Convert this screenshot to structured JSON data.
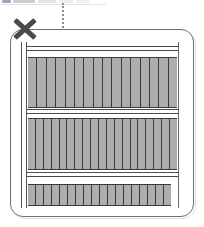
{
  "figure": {
    "background_color": "#ffffff",
    "width": 204,
    "height": 227
  },
  "top_strip": {
    "name": "cut-off-header-strip",
    "segments": [
      "",
      "",
      "",
      "",
      ""
    ],
    "colors": [
      "#8e9aa8",
      "#9aa5b1",
      "#c4d2dd",
      "#cfdbe5",
      "#d8e3eb"
    ],
    "rule_color": "#cfe0ea"
  },
  "leader_line": {
    "name": "dotted-leader-line",
    "style": "dotted",
    "color": "#7a7a7a",
    "orientation": "vertical"
  },
  "annotation": {
    "mark": "X",
    "label": "",
    "color": "#4a4a4a",
    "position": "top-left"
  },
  "panel": {
    "name": "rounded-panel",
    "border_color": "#6f6f6f",
    "fill_color": "#ffffff",
    "corner_radius": 13
  },
  "frame": {
    "rail_color": "#4a4a4a",
    "left_rail": "double-vertical-rail",
    "right_rail": "single-vertical-rail"
  },
  "bands": [
    {
      "name": "band-top",
      "bar_count": 16,
      "fill_color": "#adadad",
      "separator_color": "#3a3a3a",
      "top": 57,
      "left": 28,
      "width": 149,
      "height": 51
    },
    {
      "name": "band-middle",
      "bar_count": 19,
      "fill_color": "#adadad",
      "separator_color": "#3a3a3a",
      "top": 118,
      "left": 28,
      "width": 149,
      "height": 52
    },
    {
      "name": "band-bottom",
      "bar_count": 18,
      "fill_color": "#adadad",
      "separator_color": "#3a3a3a",
      "top": 184,
      "left": 28,
      "width": 143,
      "height": 22
    }
  ],
  "rails": [
    {
      "name": "rail-above-band-top",
      "top": 46,
      "type": "double"
    },
    {
      "name": "rail-below-band-top",
      "top": 109,
      "type": "double"
    },
    {
      "name": "rail-below-band-middle",
      "top": 172,
      "type": "double"
    }
  ]
}
